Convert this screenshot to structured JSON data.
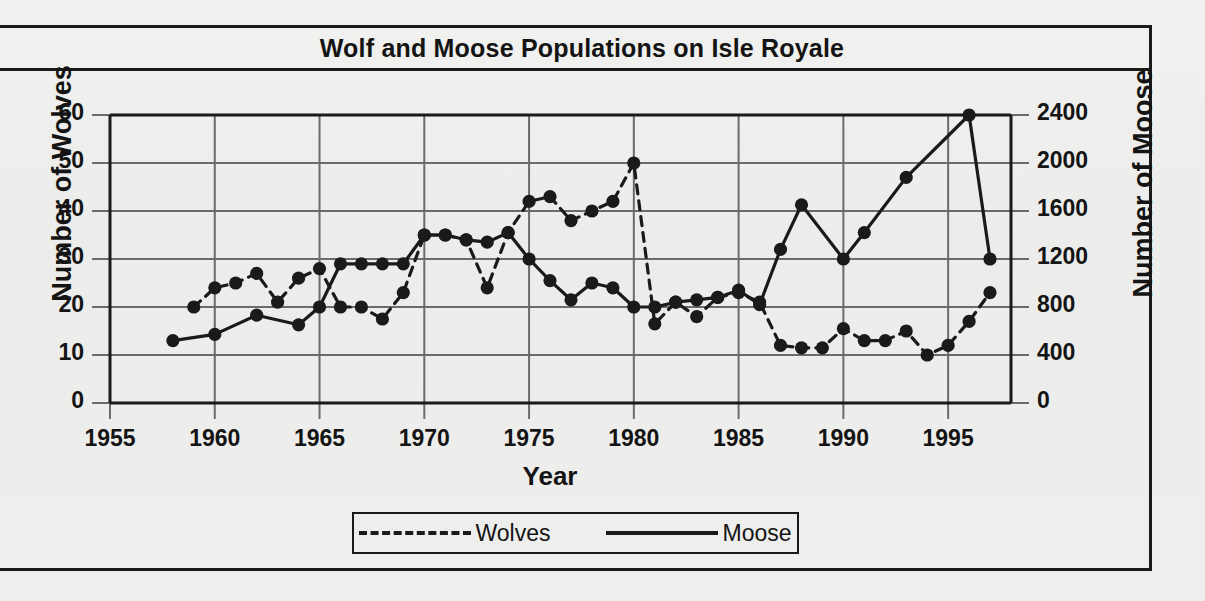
{
  "title": "Wolf and Moose Populations on Isle Royale",
  "axes": {
    "xlabel": "Year",
    "ylabel_left": "Number of Wolves",
    "ylabel_right": "Number of Moose"
  },
  "legend": {
    "wolves_label": "Wolves",
    "moose_label": "Moose",
    "wolves_style": "dashed",
    "moose_style": "solid"
  },
  "colors": {
    "ink": "#1a1a1a",
    "paper": "#eeeeec",
    "grid": "#6b6b6b"
  },
  "chart_data": {
    "type": "line",
    "title": "Wolf and Moose Populations on Isle Royale",
    "xlabel": "Year",
    "ylabel": "Number of Wolves",
    "ylabel_right": "Number of Moose",
    "xlim": [
      1955,
      1998
    ],
    "xticks": [
      1955,
      1960,
      1965,
      1970,
      1975,
      1980,
      1985,
      1990,
      1995
    ],
    "xticklabels": [
      "1955",
      "1960",
      "1965",
      "1970",
      "1975",
      "1980",
      "1985",
      "1990",
      "1995"
    ],
    "ylim_left": [
      0,
      60
    ],
    "yticks_left": [
      0,
      10,
      20,
      30,
      40,
      50,
      60
    ],
    "yticklabels_left": [
      "0",
      "10",
      "20",
      "30",
      "40",
      "50",
      "60"
    ],
    "ylim_right": [
      0,
      2400
    ],
    "yticks_right": [
      0,
      400,
      800,
      1200,
      1600,
      2000,
      2400
    ],
    "yticklabels_right": [
      "0",
      "400",
      "800",
      "1200",
      "1600",
      "2000",
      "2400"
    ],
    "grid": true,
    "legend_position": "bottom",
    "series": [
      {
        "name": "Wolves",
        "axis": "left",
        "units": "wolves",
        "style": "dashed",
        "marker": "filled-circle",
        "x": [
          1959,
          1960,
          1961,
          1962,
          1963,
          1964,
          1965,
          1966,
          1967,
          1968,
          1969,
          1970,
          1971,
          1972,
          1973,
          1974,
          1975,
          1976,
          1977,
          1978,
          1979,
          1980,
          1981,
          1982,
          1983,
          1984,
          1985,
          1986,
          1987,
          1988,
          1989,
          1990,
          1991,
          1992,
          1993,
          1994,
          1995,
          1996,
          1997
        ],
        "values": [
          20,
          24,
          25,
          27,
          21,
          26,
          28,
          20,
          20,
          17.5,
          23,
          35,
          35,
          34,
          24,
          35.5,
          42,
          43,
          38,
          40,
          42,
          50,
          16.5,
          21,
          18,
          22,
          23,
          21,
          12,
          11.5,
          11.5,
          15.5,
          13,
          13,
          15,
          10,
          12,
          17,
          23
        ]
      },
      {
        "name": "Moose",
        "axis": "right",
        "units": "moose",
        "style": "solid",
        "marker": "filled-circle",
        "x": [
          1958,
          1960,
          1962,
          1964,
          1965,
          1966,
          1967,
          1968,
          1969,
          1970,
          1971,
          1972,
          1973,
          1974,
          1975,
          1976,
          1977,
          1978,
          1979,
          1980,
          1981,
          1982,
          1983,
          1984,
          1985,
          1986,
          1987,
          1988,
          1990,
          1991,
          1993,
          1996,
          1997
        ],
        "values_left_scale": [
          13,
          14.3,
          18.3,
          16.3,
          20,
          29,
          29,
          29,
          29,
          35,
          35,
          34,
          33.5,
          35.5,
          30,
          25.5,
          21.5,
          25,
          24,
          20,
          20,
          21,
          21.5,
          22,
          23.5,
          20.5,
          32,
          41.3,
          30,
          35.5,
          47,
          60,
          30
        ],
        "values_moose": [
          520,
          572,
          732,
          652,
          800,
          1160,
          1160,
          1160,
          1160,
          1400,
          1400,
          1360,
          1340,
          1420,
          1200,
          1020,
          860,
          1000,
          960,
          800,
          800,
          840,
          860,
          880,
          940,
          820,
          1280,
          1652,
          1200,
          1420,
          1880,
          2400,
          1200
        ]
      }
    ]
  }
}
